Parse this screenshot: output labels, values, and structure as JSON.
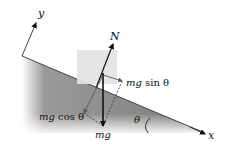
{
  "diagram": {
    "axes": {
      "x_label": "x",
      "y_label": "y"
    },
    "forces": {
      "normal": "N",
      "gravity": "mg",
      "parallel_component": "mg sin θ",
      "perpendicular_component": "mg cos θ"
    },
    "angle_label": "θ",
    "labels": {
      "N": "N",
      "mg": "mg",
      "mg_sin_prefix": "mg",
      "sin_text": " sin θ",
      "mg_cos_prefix": "mg",
      "cos_text": " cos θ",
      "theta": "θ",
      "x": "x",
      "y": "y"
    },
    "colors": {
      "incline_dark": "#808080",
      "incline_light": "#f2f2f2",
      "block": "#e6e6e6",
      "arrow": "#111111",
      "component": "#555555"
    }
  }
}
